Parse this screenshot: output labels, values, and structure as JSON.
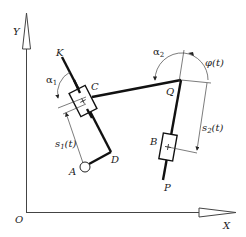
{
  "diagram": {
    "type": "kinematic-mechanism",
    "axes": {
      "origin_label": "O",
      "x_label": "X",
      "y_label": "Y"
    },
    "points": {
      "K": "K",
      "C": "C",
      "Q": "Q",
      "D": "D",
      "A": "A",
      "B": "B",
      "P": "P"
    },
    "angles": {
      "alpha1_base": "α",
      "alpha1_sub": "1",
      "alpha2_base": "α",
      "alpha2_sub": "2",
      "phi": "φ(t)"
    },
    "displacements": {
      "s1_base": "s",
      "s1_sub": "1",
      "s1_arg": "(t)",
      "s2_base": "s",
      "s2_sub": "2",
      "s2_arg": "(t)"
    },
    "colors": {
      "line": "#222222",
      "thin_line": "#444444",
      "background": "#ffffff"
    }
  }
}
